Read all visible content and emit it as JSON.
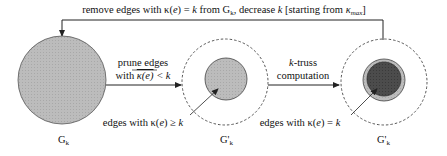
{
  "feedback": {
    "label_pre": "remove edges with κ(",
    "label_e": "e",
    "label_mid": ") = ",
    "label_k": "k",
    "label_from": " from G",
    "label_from_sub": "k",
    "label_comma": ",  decrease ",
    "label_k2": "k",
    "label_bracket": " [starting from ",
    "label_kmax": "κ",
    "label_kmax_sub": "max",
    "label_end": "]"
  },
  "nodes": [
    {
      "id": "Gk",
      "label": "G",
      "sub": "k",
      "fill": "#b8b8b8"
    },
    {
      "id": "Gk_prime_1",
      "label": "G'",
      "sub": "k",
      "fill": "#b0b0b0"
    },
    {
      "id": "Gk_prime_2",
      "label": "G'",
      "sub": "k",
      "ring_fill": "#b8b8b8",
      "core_fill": "#4a4a4a"
    }
  ],
  "arrows": [
    {
      "id": "prune",
      "line1": "prune edges",
      "line2_pre": "with ",
      "line2_over": "κ(e)",
      "line2_post": " < k"
    },
    {
      "id": "ktruss",
      "line1_k": "k",
      "line1_rest": "-truss",
      "line2": "computation"
    }
  ],
  "annotations": [
    {
      "id": "ge",
      "text_pre": "edges with κ(",
      "text_e": "e",
      "text_post": ") ≥ ",
      "text_k": "k"
    },
    {
      "id": "eq",
      "text_pre": "edges with κ(",
      "text_e": "e",
      "text_post": ") = ",
      "text_k": "k"
    }
  ],
  "colors": {
    "stroke": "#222222",
    "dashed": "#444444"
  }
}
